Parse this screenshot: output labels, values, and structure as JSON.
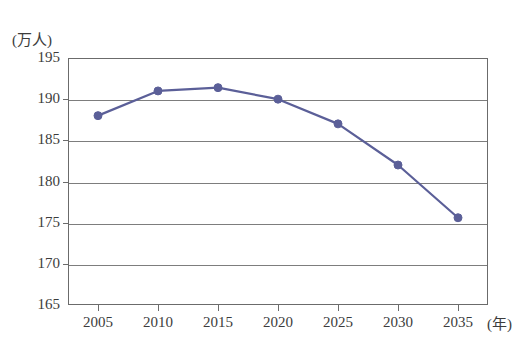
{
  "chart_data": {
    "type": "line",
    "title": "",
    "subtitle": "",
    "xlabel": "(年)",
    "ylabel": "(万人)",
    "x": [
      2005,
      2010,
      2015,
      2020,
      2025,
      2030,
      2035
    ],
    "xtick_labels": [
      "2005",
      "2010",
      "2015",
      "2020",
      "2025",
      "2030",
      "2035"
    ],
    "ytick_labels": [
      "195",
      "190",
      "185",
      "180",
      "175",
      "170",
      "165"
    ],
    "yticks": [
      195,
      190,
      185,
      180,
      175,
      170,
      165
    ],
    "ylim": [
      165,
      195
    ],
    "xlim": [
      2002.5,
      2037.5
    ],
    "grid": "horizontal",
    "legend": "none",
    "series": [
      {
        "name": "",
        "color": "#5b5f98",
        "marker": "circle",
        "values": [
          188.0,
          191.0,
          191.4,
          190.0,
          187.0,
          182.0,
          175.6
        ]
      }
    ]
  }
}
